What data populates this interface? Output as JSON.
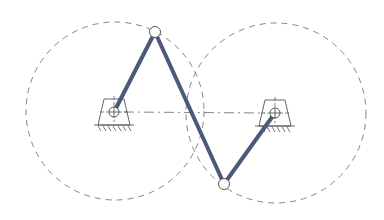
{
  "diagram": {
    "type": "four-bar crossed linkage (double crank)",
    "colors": {
      "background": "#ffffff",
      "link": "#4a5a78",
      "outline": "#555555",
      "dashed": "#777777",
      "joint_fill": "#ffffff"
    },
    "paths": [
      {
        "name": "left-crank-path-circle",
        "cx": 115,
        "cy": 111,
        "r": 89
      },
      {
        "name": "right-crank-path-circle",
        "cx": 276,
        "cy": 113,
        "r": 90
      }
    ],
    "pivots": [
      {
        "name": "left-ground-pivot",
        "x": 114,
        "y": 112
      },
      {
        "name": "right-ground-pivot",
        "x": 275,
        "y": 113
      }
    ],
    "joints": [
      {
        "name": "top-joint",
        "x": 155,
        "y": 32
      },
      {
        "name": "bottom-joint",
        "x": 224,
        "y": 184
      }
    ],
    "links": [
      {
        "name": "left-crank-link",
        "from": "left-ground-pivot",
        "to": "top-joint"
      },
      {
        "name": "coupler-link",
        "from": "top-joint",
        "to": "bottom-joint"
      },
      {
        "name": "right-crank-link",
        "from": "bottom-joint",
        "to": "right-ground-pivot"
      }
    ],
    "ground_line": {
      "name": "frame-centerline",
      "dashed": true
    }
  }
}
